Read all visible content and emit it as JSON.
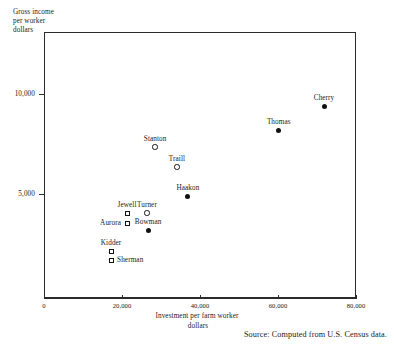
{
  "chart_data": {
    "type": "scatter",
    "title": "",
    "xlabel": "Investment per farm worker",
    "xlabel_line2": "dollars",
    "ylabel": "Gross income",
    "ylabel_line2": "per worker",
    "ylabel_line3": "dollars",
    "xlim": [
      0,
      80000
    ],
    "ylim": [
      0,
      13300
    ],
    "xticks": [
      0,
      20000,
      40000,
      60000,
      80000
    ],
    "xticklabels": [
      "0",
      "20,000",
      "40,000",
      "60,000",
      "80,000"
    ],
    "yticks": [
      5000,
      10000
    ],
    "yticklabels": [
      "5,000",
      "10,000"
    ],
    "grid": false,
    "legend": "none",
    "source": "Source: Computed from U.S. Census data.",
    "points": [
      {
        "name": "Cherry",
        "x": 71800,
        "y": 9600,
        "marker": "circle-filled",
        "label_pos": "above"
      },
      {
        "name": "Thomas",
        "x": 60200,
        "y": 8400,
        "marker": "circle-filled",
        "label_pos": "above"
      },
      {
        "name": "Stanton",
        "x": 28500,
        "y": 7550,
        "marker": "circle-open",
        "label_pos": "above"
      },
      {
        "name": "Traill",
        "x": 34100,
        "y": 6550,
        "marker": "circle-open",
        "label_pos": "above"
      },
      {
        "name": "Haakon",
        "x": 36900,
        "y": 5100,
        "marker": "circle-filled",
        "label_pos": "above"
      },
      {
        "name": "Turner",
        "x": 26400,
        "y": 4250,
        "marker": "circle-open",
        "label_pos": "above"
      },
      {
        "name": "Jewell",
        "x": 21300,
        "y": 4250,
        "marker": "square-open",
        "label_pos": "above"
      },
      {
        "name": "Aurora",
        "x": 21300,
        "y": 3750,
        "marker": "square-open",
        "label_pos": "left"
      },
      {
        "name": "Bowman",
        "x": 26700,
        "y": 3400,
        "marker": "circle-filled",
        "label_pos": "above"
      },
      {
        "name": "Kidder",
        "x": 17200,
        "y": 2350,
        "marker": "square-open",
        "label_pos": "above"
      },
      {
        "name": "Sherman",
        "x": 17200,
        "y": 1900,
        "marker": "square-open",
        "label_pos": "right"
      }
    ]
  },
  "axes": {
    "y_caption_line1": "Gross income",
    "y_caption_line2": "per worker",
    "y_caption_line3": "dollars",
    "x_caption_line1": "Investment per farm worker",
    "x_caption_line2": "dollars",
    "ytick_5000": "5,000",
    "ytick_10000": "10,000",
    "xtick_0": "0",
    "xtick_20000": "20,000",
    "xtick_40000": "40,000",
    "xtick_60000": "60,000",
    "xtick_80000": "80,000"
  },
  "footer": {
    "source": "Source: Computed from U.S. Census data."
  }
}
